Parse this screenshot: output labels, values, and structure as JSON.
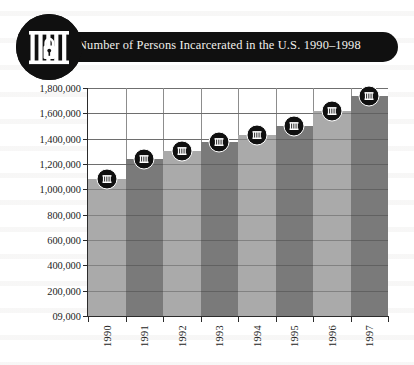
{
  "header": {
    "title": "Number of Persons Incarcerated in the U.S. 1990–1998",
    "badge_icon": "jail-bars-padlock-icon",
    "band_color": "#101010",
    "title_color": "#f2f0ec"
  },
  "chart_data": {
    "type": "bar",
    "title": "Number of Persons Incarcerated in the U.S. 1990–1998",
    "xlabel": "",
    "ylabel": "",
    "categories": [
      "1990",
      "1991",
      "1992",
      "1993",
      "1994",
      "1995",
      "1996",
      "1997"
    ],
    "values": [
      1080000,
      1240000,
      1300000,
      1370000,
      1430000,
      1500000,
      1620000,
      1740000
    ],
    "ylim": [
      0,
      1800000
    ],
    "ytick_labels": [
      "1,800,000",
      "1,600,000",
      "1,400,000",
      "1,200,000",
      "1,000,000",
      "800,000",
      "600,000",
      "400,000",
      "200,000",
      "09,000"
    ],
    "ytick_values": [
      1800000,
      1600000,
      1400000,
      1200000,
      1000000,
      800000,
      600000,
      400000,
      200000,
      0
    ],
    "grid": true,
    "legend": "none",
    "bar_colors": [
      "#aaaaaa",
      "#7a7a7a"
    ],
    "marker_icon": "jail-bars-marker-icon",
    "marker_fill": "#101010",
    "axis_color": "#2b2b2b",
    "grid_color": "#8d8d8d",
    "plot_background": "#ffffff"
  }
}
